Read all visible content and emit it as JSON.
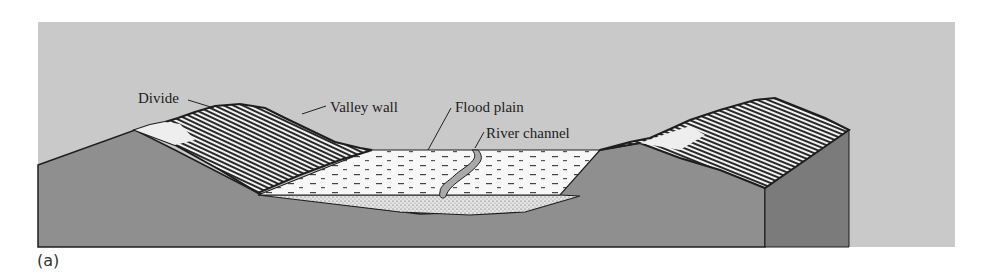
{
  "figure": {
    "panel_label": "(a)",
    "labels": {
      "divide": "Divide",
      "valley_wall": "Valley wall",
      "flood_plain": "Flood plain",
      "river_channel": "River channel"
    },
    "colors": {
      "sky": "#c9c9c9",
      "ground": "#8f8f8f",
      "block_side": "#7b7b7b",
      "flood_plain": "#f6f6f6",
      "sediment": "#d9d9d9",
      "outline": "#1e1e1e"
    }
  }
}
